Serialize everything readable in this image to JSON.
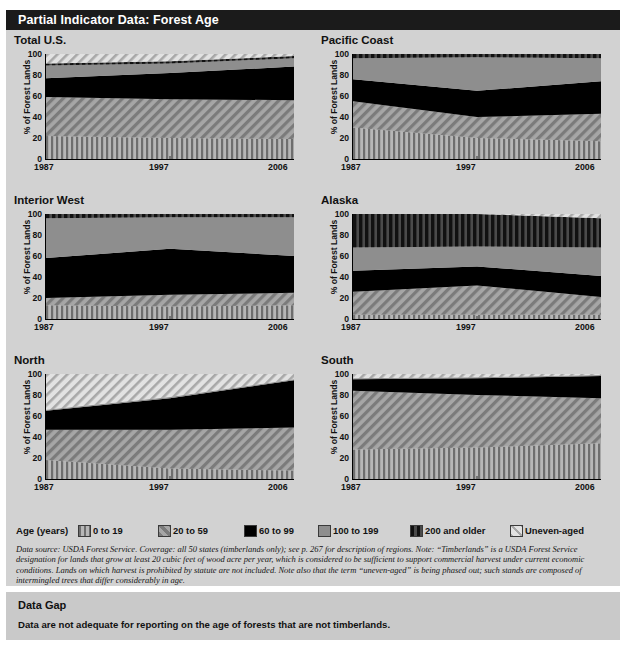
{
  "header": {
    "title": "Partial Indicator Data: Forest Age"
  },
  "axis": {
    "ylabel": "% of Forest Lands",
    "yticks": [
      0,
      20,
      40,
      60,
      80,
      100
    ],
    "xticks": [
      "1987",
      "1997",
      "2006"
    ]
  },
  "legend": {
    "title": "Age (years)",
    "items": [
      {
        "label": "0 to 19",
        "pattern": "vertical-stripe",
        "color": "#8a8a8a"
      },
      {
        "label": "20 to 59",
        "pattern": "diagonal-hatch",
        "color": "#9a9a9a"
      },
      {
        "label": "60 to 99",
        "pattern": "solid",
        "color": "#000000"
      },
      {
        "label": "100 to 199",
        "pattern": "solid-gray",
        "color": "#8e8e8e"
      },
      {
        "label": "200 and older",
        "pattern": "thick-vertical",
        "color": "#2a2a2a"
      },
      {
        "label": "Uneven-aged",
        "pattern": "light-diagonal",
        "color": "#d8d8d8"
      }
    ]
  },
  "note": "Data source: USDA Forest Service. Coverage: all 50 states (timberlands only); see p. 267 for description of regions. Note: “Timberlands” is a USDA Forest Service designation for lands that grow at least 20 cubic feet of wood acre per year, which is considered to be sufficient to support commercial harvest under current economic conditions. Lands on which harvest is prohibited by statute are not included. Note also that the term “uneven-aged” is being phased out; such stands are composed of intermingled trees that differ considerably in age.",
  "data_gap": {
    "heading": "Data Gap",
    "body": "Data are not adequate for reporting on the age of forests that are not timberlands."
  },
  "chart_data": {
    "type": "area",
    "title": "Partial Indicator Data: Forest Age",
    "xlabel": "",
    "ylabel": "% of Forest Lands",
    "ylim": [
      0,
      100
    ],
    "x": [
      1987,
      1997,
      2006
    ],
    "xtick_labels": [
      "1987",
      "1997",
      "2006"
    ],
    "grid": false,
    "legend_position": "bottom",
    "series_order": [
      "0 to 19",
      "20 to 59",
      "60 to 99",
      "100 to 199",
      "200 and older",
      "Uneven-aged"
    ],
    "panels": [
      {
        "name": "Total U.S.",
        "series": [
          {
            "name": "0 to 19",
            "values": [
              22,
              20,
              19
            ]
          },
          {
            "name": "20 to 59",
            "values": [
              37,
              37,
              37
            ]
          },
          {
            "name": "60 to 99",
            "values": [
              18,
              25,
              32
            ]
          },
          {
            "name": "100 to 199",
            "values": [
              12,
              9,
              8
            ]
          },
          {
            "name": "200 and older",
            "values": [
              2,
              2,
              2
            ]
          },
          {
            "name": "Uneven-aged",
            "values": [
              9,
              7,
              2
            ]
          }
        ]
      },
      {
        "name": "Pacific Coast",
        "series": [
          {
            "name": "0 to 19",
            "values": [
              30,
              20,
              17
            ]
          },
          {
            "name": "20 to 59",
            "values": [
              25,
              20,
              26
            ]
          },
          {
            "name": "60 to 99",
            "values": [
              21,
              25,
              31
            ]
          },
          {
            "name": "100 to 199",
            "values": [
              20,
              32,
              22
            ]
          },
          {
            "name": "200 and older",
            "values": [
              4,
              3,
              4
            ]
          },
          {
            "name": "Uneven-aged",
            "values": [
              0,
              0,
              0
            ]
          }
        ]
      },
      {
        "name": "Interior West",
        "series": [
          {
            "name": "0 to 19",
            "values": [
              13,
              12,
              13
            ]
          },
          {
            "name": "20 to 59",
            "values": [
              7,
              11,
              12
            ]
          },
          {
            "name": "60 to 99",
            "values": [
              38,
              44,
              35
            ]
          },
          {
            "name": "100 to 199",
            "values": [
              38,
              30,
              37
            ]
          },
          {
            "name": "200 and older",
            "values": [
              4,
              3,
              3
            ]
          },
          {
            "name": "Uneven-aged",
            "values": [
              0,
              0,
              0
            ]
          }
        ]
      },
      {
        "name": "Alaska",
        "series": [
          {
            "name": "0 to 19",
            "values": [
              4,
              4,
              4
            ]
          },
          {
            "name": "20 to 59",
            "values": [
              22,
              28,
              17
            ]
          },
          {
            "name": "60 to 99",
            "values": [
              20,
              18,
              20
            ]
          },
          {
            "name": "100 to 199",
            "values": [
              22,
              19,
              27
            ]
          },
          {
            "name": "200 and older",
            "values": [
              32,
              31,
              28
            ]
          },
          {
            "name": "Uneven-aged",
            "values": [
              0,
              0,
              4
            ]
          }
        ]
      },
      {
        "name": "North",
        "series": [
          {
            "name": "0 to 19",
            "values": [
              18,
              10,
              8
            ]
          },
          {
            "name": "20 to 59",
            "values": [
              29,
              37,
              41
            ]
          },
          {
            "name": "60 to 99",
            "values": [
              18,
              30,
              45
            ]
          },
          {
            "name": "100 to 199",
            "values": [
              1,
              1,
              1
            ]
          },
          {
            "name": "200 and older",
            "values": [
              0,
              0,
              0
            ]
          },
          {
            "name": "Uneven-aged",
            "values": [
              34,
              22,
              5
            ]
          }
        ]
      },
      {
        "name": "South",
        "series": [
          {
            "name": "0 to 19",
            "values": [
              28,
              30,
              34
            ]
          },
          {
            "name": "20 to 59",
            "values": [
              56,
              50,
              43
            ]
          },
          {
            "name": "60 to 99",
            "values": [
              11,
              16,
              21
            ]
          },
          {
            "name": "100 to 199",
            "values": [
              1,
              1,
              1
            ]
          },
          {
            "name": "200 and older",
            "values": [
              0,
              0,
              0
            ]
          },
          {
            "name": "Uneven-aged",
            "values": [
              4,
              3,
              1
            ]
          }
        ]
      }
    ]
  }
}
